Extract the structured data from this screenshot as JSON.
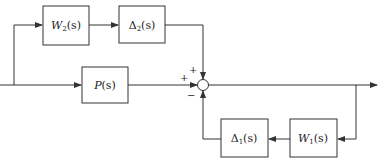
{
  "diagram": {
    "type": "block-diagram",
    "blocks": {
      "w2": {
        "name": "W",
        "sub": "2",
        "arg": "(s)"
      },
      "delta2": {
        "name": "Δ",
        "sub": "2",
        "arg": "(s)"
      },
      "p": {
        "name": "P",
        "sub": "",
        "arg": "(s)"
      },
      "delta1": {
        "name": "Δ",
        "sub": "1",
        "arg": "(s)"
      },
      "w1": {
        "name": "W",
        "sub": "1",
        "arg": "(s)"
      }
    },
    "summing_junction": {
      "signs": {
        "top": "+",
        "left": "+",
        "bottom": "−"
      }
    },
    "colors": {
      "stroke": "#333333",
      "background": "#ffffff",
      "text": "#222222"
    }
  }
}
